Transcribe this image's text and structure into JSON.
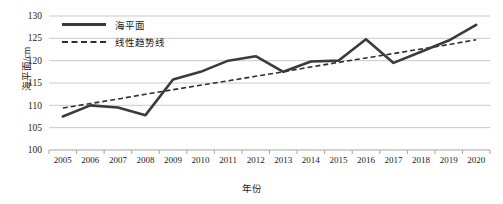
{
  "chart_data": {
    "type": "line",
    "title": "",
    "xlabel": "年份",
    "ylabel": "海平面/cm",
    "categories": [
      "2005",
      "2006",
      "2007",
      "2008",
      "2009",
      "2010",
      "2011",
      "2012",
      "2013",
      "2014",
      "2015",
      "2016",
      "2017",
      "2018",
      "2019",
      "2020"
    ],
    "ylim": [
      100,
      130
    ],
    "yticks": [
      100,
      105,
      110,
      115,
      120,
      125,
      130
    ],
    "ytick_labels": [
      "100",
      "105",
      "110",
      "115",
      "120",
      "125",
      "130"
    ],
    "grid": true,
    "legend_position": "top-left",
    "series": [
      {
        "name": "海平面",
        "style": "solid",
        "color": "#3b3b3b",
        "values": [
          107.5,
          110.0,
          109.5,
          107.8,
          115.8,
          117.5,
          120.0,
          121.0,
          117.5,
          119.8,
          120.0,
          124.8,
          119.5,
          122.0,
          124.5,
          128.0
        ]
      },
      {
        "name": "线性趋势线",
        "style": "dashed",
        "color": "#2e2e2e",
        "values": [
          109.4,
          110.4,
          111.4,
          112.5,
          113.5,
          114.5,
          115.5,
          116.5,
          117.5,
          118.6,
          119.6,
          120.6,
          121.6,
          122.6,
          123.6,
          124.7
        ]
      }
    ]
  },
  "legend": {
    "items": [
      {
        "label": "海平面",
        "style": "solid"
      },
      {
        "label": "线性趋势线",
        "style": "dashed"
      }
    ]
  },
  "axes": {
    "y_title": "海平面/cm",
    "x_title": "年份"
  },
  "colors": {
    "series_line": "#3b3b3b",
    "trend_line": "#2e2e2e",
    "gridline": "#c9c9c9",
    "axis": "#a6a6a6",
    "text": "#1a1a1a",
    "background": "#ffffff"
  }
}
